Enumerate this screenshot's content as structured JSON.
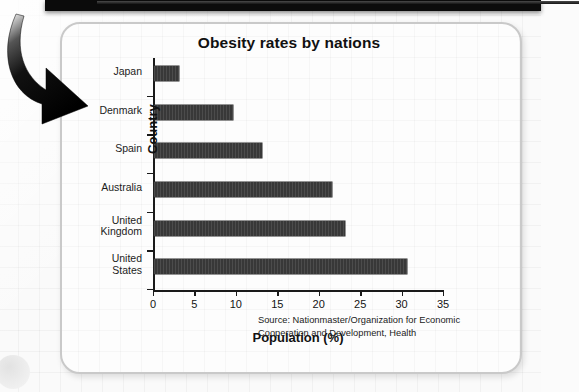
{
  "page": {
    "background_color": "#fafafa",
    "top_bar_color": "#0b0b0b",
    "card_border_color": "#c9c9c9",
    "arrow_color": "#111111"
  },
  "chart_data": {
    "type": "bar",
    "orientation": "horizontal",
    "title": "Obesity rates by nations",
    "xlabel": "Population (%)",
    "ylabel": "Country",
    "categories": [
      "Japan",
      "Denmark",
      "Spain",
      "Australia",
      "United\nKingdom",
      "United\nStates"
    ],
    "values": [
      3,
      9.5,
      13,
      21.5,
      23,
      30.5
    ],
    "xlim": [
      0,
      35
    ],
    "xticks": [
      0,
      5,
      10,
      15,
      20,
      25,
      30,
      35
    ],
    "xtick_labels": [
      "0",
      "5",
      "10",
      "15",
      "20",
      "25",
      "30",
      "35"
    ],
    "grid": false,
    "legend": "none",
    "bar_color": "#383838",
    "axis_color": "#1a1a1a"
  },
  "source": {
    "line1": "Source: Nationmaster/Organization for Economic",
    "line2": "Cooperation and Development, Health"
  }
}
